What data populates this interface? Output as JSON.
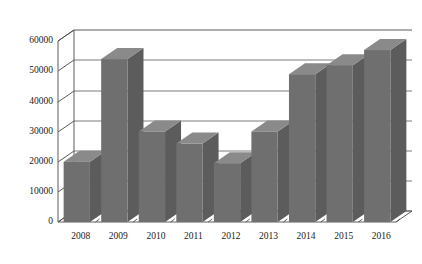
{
  "chart_data": {
    "type": "bar",
    "title": "",
    "subtitle": "",
    "xlabel": "",
    "ylabel": "",
    "categories": [
      "2008",
      "2009",
      "2010",
      "2011",
      "2012",
      "2013",
      "2014",
      "2015",
      "2016"
    ],
    "values": [
      20000,
      54000,
      30000,
      26000,
      19500,
      30000,
      49000,
      52000,
      57000
    ],
    "series": [
      {
        "name": "",
        "values": [
          20000,
          54000,
          30000,
          26000,
          19500,
          30000,
          49000,
          52000,
          57000
        ]
      }
    ],
    "ylim": [
      0,
      60000
    ],
    "ytick_values": [
      0,
      10000,
      20000,
      30000,
      40000,
      50000,
      60000
    ],
    "ytick_labels": [
      "0",
      "10000",
      "20000",
      "30000",
      "40000",
      "50000",
      "60000"
    ],
    "grid": true,
    "grid_axis": "y",
    "legend": false,
    "legend_position": "none",
    "style": "3d",
    "bar_color": "#6f6f6f",
    "bar_top_color": "#8a8a8a",
    "bar_side_color": "#5c5c5c",
    "axis_color": "#4a4a4a",
    "grid_color": "#5a5a5a",
    "background_color": "#ffffff",
    "annotations": []
  },
  "axes": {
    "y_ticks": [
      {
        "label": "60000",
        "value": 60000
      },
      {
        "label": "50000",
        "value": 50000
      },
      {
        "label": "40000",
        "value": 40000
      },
      {
        "label": "30000",
        "value": 30000
      },
      {
        "label": "20000",
        "value": 20000
      },
      {
        "label": "10000",
        "value": 10000
      },
      {
        "label": "0",
        "value": 0
      }
    ],
    "x_ticks": [
      {
        "label": "2008"
      },
      {
        "label": "2009"
      },
      {
        "label": "2010"
      },
      {
        "label": "2011"
      },
      {
        "label": "2012"
      },
      {
        "label": "2013"
      },
      {
        "label": "2014"
      },
      {
        "label": "2015"
      },
      {
        "label": "2016"
      }
    ]
  }
}
